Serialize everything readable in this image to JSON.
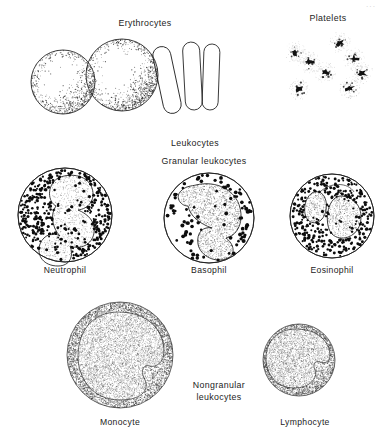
{
  "figure": {
    "title_visible": false,
    "corner_mark": "···",
    "background_color": "#ffffff",
    "ink_color": "#1c1c1c",
    "groups": [
      {
        "id": "erythrocytes",
        "label": "Erythrocytes",
        "label_x": 145,
        "label_y": 26
      },
      {
        "id": "platelets",
        "label": "Platelets",
        "label_x": 328,
        "label_y": 21
      },
      {
        "id": "leukocytes",
        "label": "Leukocytes",
        "label_x": 195,
        "label_y": 146
      },
      {
        "id": "granular-leukocytes",
        "label": "Granular leukocytes",
        "label_x": 204,
        "label_y": 164
      },
      {
        "id": "nongranular-leukocytes",
        "label_line1": "Nongranular",
        "label_line2": "leukocytes",
        "label_x": 219,
        "label_y": 394
      }
    ],
    "cells": [
      {
        "id": "erythrocyte-face-1",
        "label": "",
        "type": "erythrocyte-face",
        "cx": 63,
        "cy": 82,
        "r": 32
      },
      {
        "id": "erythrocyte-face-2",
        "label": "",
        "type": "erythrocyte-face",
        "cx": 122,
        "cy": 75,
        "r": 36
      },
      {
        "id": "erythrocyte-edge-1",
        "label": "",
        "type": "erythrocyte-edge",
        "cx": 167,
        "cy": 80,
        "rotation": -12
      },
      {
        "id": "erythrocyte-edge-2",
        "label": "",
        "type": "erythrocyte-edge",
        "cx": 193,
        "cy": 76,
        "rotation": -3
      },
      {
        "id": "erythrocyte-edge-3",
        "label": "",
        "type": "erythrocyte-edge",
        "cx": 211,
        "cy": 77,
        "rotation": 2
      },
      {
        "id": "neutrophil",
        "label": "Neutrophil",
        "type": "granulocyte",
        "cx": 65,
        "cy": 215,
        "r": 47,
        "label_x": 65,
        "label_y": 273,
        "lobes": 4,
        "granule_density": "high"
      },
      {
        "id": "basophil",
        "label": "Basophil",
        "type": "granulocyte",
        "cx": 209,
        "cy": 218,
        "r": 45,
        "label_x": 209,
        "label_y": 273,
        "lobes": 2,
        "granule_density": "low"
      },
      {
        "id": "eosinophil",
        "label": "Eosinophil",
        "type": "granulocyte",
        "cx": 332,
        "cy": 216,
        "r": 42,
        "label_x": 332,
        "label_y": 273,
        "lobes": 2,
        "granule_density": "high"
      },
      {
        "id": "monocyte",
        "label": "Monocyte",
        "type": "agranulocyte",
        "cx": 120,
        "cy": 355,
        "r": 53,
        "label_x": 120,
        "label_y": 425,
        "nucleus": "kidney-shaped"
      },
      {
        "id": "lymphocyte",
        "label": "Lymphocyte",
        "type": "agranulocyte",
        "cx": 299,
        "cy": 360,
        "r": 36,
        "label_x": 305,
        "label_y": 425,
        "nucleus": "round-large"
      }
    ],
    "platelets": [
      {
        "cx": 295,
        "cy": 52
      },
      {
        "cx": 340,
        "cy": 43
      },
      {
        "cx": 309,
        "cy": 62
      },
      {
        "cx": 354,
        "cy": 59
      },
      {
        "cx": 325,
        "cy": 72
      },
      {
        "cx": 299,
        "cy": 89
      },
      {
        "cx": 350,
        "cy": 88
      },
      {
        "cx": 362,
        "cy": 73
      }
    ]
  }
}
